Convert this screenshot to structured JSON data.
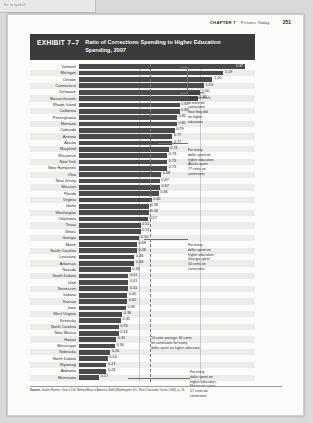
{
  "scan_note": "Fix to eyeball",
  "page_header": {
    "chapter": "CHAPTER 7",
    "title": "Prisons Today",
    "page_number": "251"
  },
  "exhibit": {
    "label": "EXHIBIT 7–7",
    "title": "Ratio of Corrections Spending to Higher Education Spending, 2007"
  },
  "annotations": {
    "five_states": "Five states\nspent as much\nor more on\ncorrections\nthan they did\non higher\neducation",
    "alaska": "For every\ndollar spent on\nhigher education,\nAlaska spent\n77 cents on\ncorrections",
    "georgia": "For every\ndollar spent on\nhigher education,\nGeorgia spent\n50 cents on\ncorrections",
    "average": "50-state average: 60 cents\non corrections for every\ndollar spent on higher education",
    "minnesota": "For every\ndollar spent on\nhigher education,\nMinnesota spent\n17 cents on\ncorrections"
  },
  "source": {
    "label": "Source:",
    "text": "Jackie Warren, One in 100: Behind Bars in America 2008 (Washington, DC: Pew Charitable Trusts, 2008), p. 16."
  },
  "chart_data": {
    "type": "bar",
    "orientation": "horizontal",
    "title": "Ratio of Corrections Spending to Higher Education Spending, 2007",
    "xlabel": "",
    "ylabel": "",
    "xlim": [
      0,
      1.45
    ],
    "grid": true,
    "legend": "none",
    "categories": [
      "Vermont",
      "Michigan",
      "Oregon",
      "Connecticut",
      "Delaware",
      "Massachusetts",
      "Rhode Island",
      "California",
      "Pennsylvania",
      "Montana",
      "Colorado",
      "Arizona",
      "Alaska",
      "Maryland",
      "Wisconsin",
      "New York",
      "New Hampshire",
      "Ohio",
      "New Jersey",
      "Missouri",
      "Florida",
      "Virginia",
      "Idaho",
      "Washington",
      "Oklahoma",
      "Texas",
      "Illinois",
      "Georgia",
      "Maine",
      "South Carolina",
      "Louisiana",
      "Arkansas",
      "Nevada",
      "South Dakota",
      "Utah",
      "Tennessee",
      "Indiana",
      "Kansas",
      "Iowa",
      "West Virginia",
      "Kentucky",
      "North Carolina",
      "New Mexico",
      "Hawaii",
      "Mississippi",
      "Nebraska",
      "North Dakota",
      "Wyoming",
      "Alabama",
      "Minnesota"
    ],
    "values": [
      1.37,
      1.19,
      1.1,
      1.03,
      1.0,
      0.98,
      0.83,
      0.83,
      0.81,
      0.81,
      0.79,
      0.77,
      0.77,
      0.74,
      0.73,
      0.73,
      0.73,
      0.68,
      0.67,
      0.67,
      0.66,
      0.6,
      0.58,
      0.58,
      0.57,
      0.51,
      0.51,
      0.5,
      0.48,
      0.48,
      0.46,
      0.46,
      0.43,
      0.41,
      0.41,
      0.41,
      0.4,
      0.4,
      0.39,
      0.36,
      0.35,
      0.33,
      0.33,
      0.31,
      0.3,
      0.26,
      0.24,
      0.23,
      0.23,
      0.17
    ],
    "value_labels": [
      "1.37",
      "1.19",
      "1.10",
      "1.03",
      "1.00",
      "0.98",
      "0.83",
      "0.83",
      "0.81",
      "0.81",
      "0.79",
      "0.77",
      "0.77",
      "0.74",
      "0.73",
      "0.73",
      "0.73",
      "0.68",
      "0.67",
      "0.67",
      "0.66",
      "0.60",
      "0.58",
      "0.58",
      "0.57",
      "0.51",
      "0.51",
      "0.50",
      "0.48",
      "0.48",
      "0.46",
      "0.46",
      "0.43",
      "0.41",
      "0.41",
      "0.41",
      "0.40",
      "0.40",
      "0.39",
      "0.36",
      "0.35",
      "0.33",
      "0.33",
      "0.31",
      "0.30",
      "0.26",
      "0.24",
      "0.23",
      "0.23",
      "0.17"
    ],
    "gridlines": [
      0.5,
      1.0
    ],
    "average_value": 0.6
  }
}
